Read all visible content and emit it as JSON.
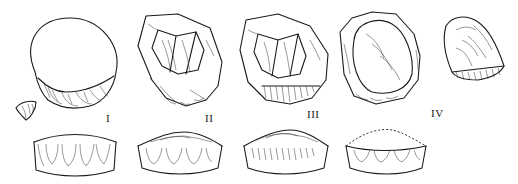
{
  "figure": {
    "stages": [
      {
        "label": "I",
        "x": 106,
        "y": 112
      },
      {
        "label": "II",
        "x": 205,
        "y": 112
      },
      {
        "label": "III",
        "x": 307,
        "y": 108
      },
      {
        "label": "IV",
        "x": 431,
        "y": 107
      }
    ],
    "colors": {
      "line": "#1a1a1a",
      "background": "#ffffff"
    }
  }
}
